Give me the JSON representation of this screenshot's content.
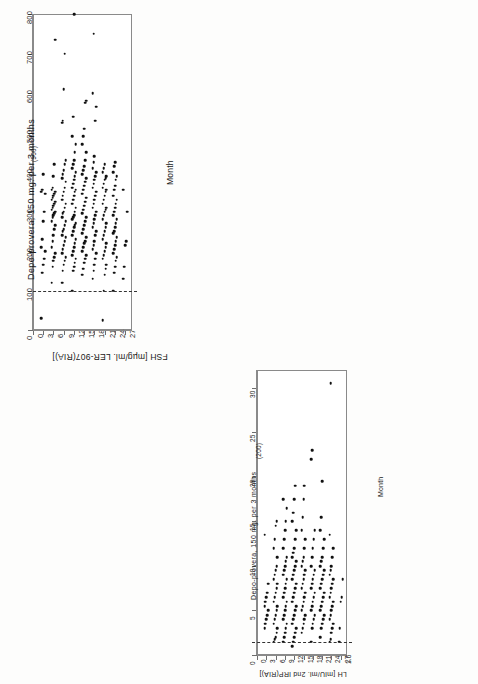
{
  "figure": {
    "orientation_note": "page scanned sideways; both panels rotated 90 degrees",
    "panels": [
      {
        "id": "fsh",
        "title": "Depo-provera, 150 mg. per 3 months",
        "value_axis": {
          "label": "FSH [mµg/ml. LER-907(RIA)]",
          "ticks": [
            "0",
            "100",
            "200",
            "300",
            "400",
            "500",
            "600",
            "700",
            "800"
          ],
          "min": 0,
          "max": 800
        },
        "category_axis": {
          "label": "Month",
          "ticks": [
            "0",
            "3",
            "6",
            "9",
            "12",
            "15",
            "18",
            "21",
            "24",
            "27+"
          ]
        },
        "threshold_value": 100,
        "annotation": "(900)"
      },
      {
        "id": "lh",
        "title": "Depo-provera, 150 mg. per 3 months",
        "value_axis": {
          "label": "LH [mIU/ml. 2nd IRP(RIA)]",
          "ticks": [
            "0",
            "5",
            "10",
            "15",
            "20",
            "25",
            "30"
          ],
          "min": 0,
          "max": 32
        },
        "category_axis": {
          "label": "Month",
          "ticks": [
            "0",
            "3",
            "6",
            "9",
            "12",
            "15",
            "18",
            "21",
            "24",
            "27+"
          ]
        },
        "threshold_value": 1.5,
        "threshold_label": "1.5",
        "annotation": "(200)"
      }
    ]
  },
  "chart_data": [
    {
      "type": "scatter",
      "id": "fsh-dot-plot",
      "title": "Depo-provera, 150 mg. per 3 months",
      "xlabel": "Month",
      "ylabel": "FSH [mµg/ml. LER-907(RIA)]",
      "xlim": [
        0,
        29
      ],
      "ylim": [
        0,
        800
      ],
      "grid": false,
      "legend": null,
      "threshold_line": 100,
      "annotations": [
        {
          "text": "(900)",
          "x": 0,
          "y": 800
        }
      ],
      "categories": [
        3,
        6,
        9,
        12,
        15,
        18,
        21,
        24,
        27
      ],
      "series": [
        {
          "name": "Month 3",
          "x": 3,
          "values": [
            30,
            145,
            165,
            180,
            200,
            210,
            230,
            275,
            300,
            345,
            350,
            355,
            395
          ]
        },
        {
          "name": "Month 6",
          "x": 6,
          "values": [
            120,
            160,
            175,
            185,
            195,
            210,
            225,
            240,
            255,
            265,
            275,
            285,
            290,
            295,
            300,
            305,
            310,
            315,
            320,
            325,
            330,
            335,
            340,
            345,
            350,
            355,
            360,
            390,
            420,
            735
          ]
        },
        {
          "name": "Month 9",
          "x": 9,
          "values": [
            120,
            150,
            165,
            175,
            185,
            195,
            205,
            215,
            225,
            235,
            240,
            250,
            255,
            265,
            275,
            285,
            295,
            300,
            310,
            320,
            330,
            340,
            350,
            360,
            375,
            385,
            395,
            405,
            420,
            430,
            525,
            530,
            610,
            700
          ]
        },
        {
          "name": "Month 12",
          "x": 12,
          "values": [
            100,
            150,
            160,
            170,
            180,
            190,
            200,
            210,
            220,
            230,
            240,
            250,
            260,
            265,
            270,
            280,
            285,
            290,
            300,
            310,
            320,
            330,
            340,
            350,
            355,
            360,
            370,
            380,
            390,
            400,
            410,
            420,
            430,
            450,
            470,
            490,
            540,
            900
          ]
        },
        {
          "name": "Month 15",
          "x": 15,
          "values": [
            140,
            155,
            170,
            180,
            190,
            200,
            210,
            220,
            225,
            235,
            245,
            255,
            265,
            275,
            285,
            295,
            305,
            315,
            325,
            335,
            345,
            355,
            365,
            375,
            385,
            395,
            405,
            415,
            430,
            450,
            470,
            490,
            510,
            575,
            580
          ]
        },
        {
          "name": "Month 18",
          "x": 18,
          "values": [
            130,
            150,
            165,
            180,
            195,
            205,
            215,
            225,
            240,
            250,
            260,
            270,
            280,
            290,
            300,
            310,
            320,
            330,
            340,
            350,
            360,
            370,
            380,
            390,
            400,
            410,
            425,
            440,
            530,
            565,
            600,
            750
          ]
        },
        {
          "name": "Month 21",
          "x": 21,
          "values": [
            25,
            100,
            140,
            155,
            165,
            180,
            190,
            200,
            210,
            220,
            230,
            240,
            250,
            260,
            270,
            280,
            290,
            300,
            305,
            310,
            320,
            330,
            340,
            350,
            355,
            360,
            370,
            380,
            385,
            390,
            400,
            410,
            420
          ]
        },
        {
          "name": "Month 24",
          "x": 24,
          "values": [
            100,
            145,
            160,
            175,
            185,
            195,
            205,
            215,
            225,
            235,
            245,
            250,
            260,
            270,
            280,
            290,
            300,
            310,
            320,
            330,
            340,
            355,
            365,
            380,
            390,
            400,
            415,
            425
          ]
        },
        {
          "name": "Month 27+",
          "x": 27,
          "values": [
            130,
            160,
            215,
            225,
            300,
            355
          ]
        }
      ]
    },
    {
      "type": "scatter",
      "id": "lh-dot-plot",
      "title": "Depo-provera, 150 mg. per 3 months",
      "xlabel": "Month",
      "ylabel": "LH [mIU/ml. 2nd IRP(RIA)]",
      "xlim": [
        0,
        29
      ],
      "ylim": [
        0,
        32
      ],
      "grid": false,
      "legend": null,
      "threshold_line": 1.5,
      "annotations": [
        {
          "text": "(200)",
          "x": 0,
          "y": 32
        }
      ],
      "categories": [
        3,
        6,
        9,
        12,
        15,
        18,
        21,
        24,
        27
      ],
      "series": [
        {
          "name": "Month 3",
          "x": 3,
          "values": [
            3.0,
            3.5,
            4.0,
            4.5,
            5.0,
            5.5,
            6.0,
            6.5,
            7.0,
            8.0,
            13.5
          ]
        },
        {
          "name": "Month 6",
          "x": 6,
          "values": [
            1.5,
            1.8,
            2.0,
            2.5,
            3.0,
            3.5,
            4.0,
            4.5,
            5.0,
            5.5,
            6.0,
            6.5,
            7.0,
            7.5,
            8.0,
            8.5,
            9.0,
            9.5,
            10.0,
            11.0,
            12.0,
            13.0,
            14.5,
            15.0
          ]
        },
        {
          "name": "Month 9",
          "x": 9,
          "values": [
            1.5,
            2.0,
            2.5,
            3.0,
            3.5,
            4.0,
            4.5,
            5.0,
            5.5,
            6.0,
            6.5,
            7.0,
            7.5,
            8.0,
            8.5,
            9.0,
            9.5,
            10.0,
            10.5,
            11.0,
            12.0,
            13.0,
            14.0,
            15.0,
            16.5,
            17.5
          ]
        },
        {
          "name": "Month 12",
          "x": 12,
          "values": [
            1.0,
            1.5,
            2.0,
            2.5,
            3.0,
            3.5,
            4.0,
            4.5,
            5.0,
            5.5,
            6.0,
            6.5,
            7.0,
            7.5,
            8.0,
            8.5,
            9.0,
            9.5,
            10.0,
            10.5,
            11.0,
            11.5,
            12.0,
            13.0,
            14.0,
            15.0,
            16.0,
            17.5,
            19.0
          ]
        },
        {
          "name": "Month 15",
          "x": 15,
          "values": [
            2.5,
            3.0,
            3.5,
            4.0,
            4.5,
            5.0,
            5.5,
            6.0,
            6.5,
            7.0,
            7.5,
            8.0,
            8.5,
            9.0,
            9.5,
            10.0,
            10.5,
            11.0,
            12.0,
            13.0,
            14.0,
            15.5,
            17.5,
            19.0
          ]
        },
        {
          "name": "Month 18",
          "x": 18,
          "values": [
            1.5,
            3.0,
            3.5,
            4.0,
            4.5,
            5.0,
            5.5,
            6.0,
            6.5,
            7.0,
            7.5,
            8.0,
            8.5,
            9.0,
            9.5,
            10.0,
            11.0,
            12.0,
            13.0,
            14.0,
            22.0,
            23.0
          ]
        },
        {
          "name": "Month 21",
          "x": 21,
          "values": [
            2.0,
            3.0,
            3.5,
            4.0,
            4.5,
            5.0,
            5.5,
            6.0,
            6.5,
            7.0,
            7.5,
            8.0,
            8.5,
            9.0,
            9.5,
            10.0,
            10.5,
            11.0,
            12.0,
            13.0,
            14.0,
            15.5,
            19.5
          ]
        },
        {
          "name": "Month 24",
          "x": 24,
          "values": [
            1.5,
            1.8,
            2.5,
            3.0,
            3.5,
            4.0,
            4.5,
            5.0,
            5.5,
            6.0,
            6.5,
            7.0,
            7.5,
            8.0,
            8.5,
            9.0,
            9.5,
            10.0,
            11.0,
            12.0,
            13.5,
            30.5
          ]
        },
        {
          "name": "Month 27+",
          "x": 27,
          "values": [
            1.5,
            3.0,
            6.0,
            6.5,
            8.5
          ]
        }
      ]
    }
  ]
}
